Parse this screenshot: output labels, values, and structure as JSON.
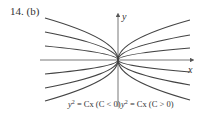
{
  "problem": {
    "number": "14.",
    "part": "(b)"
  },
  "figure": {
    "axes": {
      "x_label": "x",
      "y_label": "y"
    },
    "equation": "y² = Cx",
    "families": [
      {
        "side": "left",
        "label_main": "y",
        "label_exp": "2",
        "label_rest": " = Cx (C < 0)",
        "condition": "C < 0",
        "curve_count": 6
      },
      {
        "side": "right",
        "label_main": "y",
        "label_exp": "2",
        "label_rest": " = Cx (C > 0)",
        "condition": "C > 0",
        "curve_count": 6
      }
    ],
    "curve_color": "#444444",
    "left_endpoints_y_px_relative": null
  }
}
